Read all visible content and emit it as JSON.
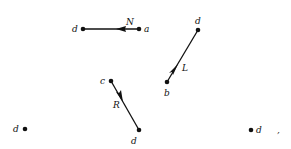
{
  "diagram": {
    "edges": [
      {
        "id": "N",
        "label": "N",
        "from": "a",
        "to": "d",
        "from_xy": [
          139,
          29
        ],
        "to_xy": [
          83,
          29
        ],
        "arrow_xy": [
          120,
          29
        ],
        "label_xy": [
          127,
          25
        ]
      },
      {
        "id": "L",
        "label": "L",
        "from": "b",
        "to": "d",
        "from_xy": [
          167,
          82
        ],
        "to_xy": [
          198,
          30
        ],
        "arrow_xy": [
          175,
          68
        ],
        "label_xy": [
          183,
          70
        ]
      },
      {
        "id": "R",
        "label": "R",
        "from": "c",
        "to": "d",
        "from_xy": [
          111,
          81
        ],
        "to_xy": [
          139,
          130
        ],
        "arrow_xy": [
          121,
          99
        ],
        "label_xy": [
          114,
          107
        ]
      }
    ],
    "nodes": [
      {
        "label": "d",
        "xy": [
          83,
          29
        ],
        "label_xy": [
          73,
          32
        ]
      },
      {
        "label": "a",
        "xy": [
          139,
          29
        ],
        "label_xy": [
          145,
          32
        ]
      },
      {
        "label": "d",
        "xy": [
          198,
          30
        ],
        "label_xy": [
          195,
          24
        ]
      },
      {
        "label": "b",
        "xy": [
          167,
          82
        ],
        "label_xy": [
          165,
          95
        ]
      },
      {
        "label": "c",
        "xy": [
          111,
          81
        ],
        "label_xy": [
          100,
          83
        ]
      },
      {
        "label": "d",
        "xy": [
          139,
          130
        ],
        "label_xy": [
          131,
          143
        ]
      },
      {
        "label": "d",
        "xy": [
          25,
          129
        ],
        "label_xy": [
          13,
          132
        ]
      },
      {
        "label": "d",
        "xy": [
          251,
          130
        ],
        "label_xy": [
          256,
          133
        ]
      }
    ],
    "trailing_mark": {
      "text": ",",
      "xy": [
        277,
        133
      ]
    }
  }
}
